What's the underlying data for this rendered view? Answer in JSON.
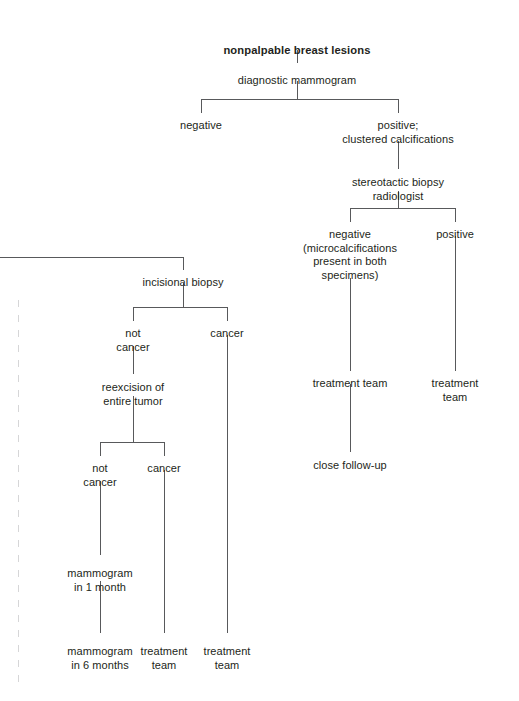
{
  "diagram": {
    "title": "nonpalpable breast lesions",
    "type": "clinical decision tree flowchart",
    "line_color": "#58595b",
    "text_color": "#231f20",
    "nodes": [
      {
        "id": "root",
        "label": "nonpalpable breast lesions",
        "x": 297,
        "y": 44,
        "bold": true
      },
      {
        "id": "dx_mammogram",
        "label": "diagnostic mammogram",
        "x": 297,
        "y": 74,
        "bold": false
      },
      {
        "id": "negative_1",
        "label": "negative",
        "x": 201,
        "y": 119,
        "bold": false
      },
      {
        "id": "positive_clustered",
        "label": "positive;\nclustered calcifications",
        "x": 398,
        "y": 119,
        "bold": false
      },
      {
        "id": "stereotactic",
        "label": "stereotactic biopsy\nradiologist",
        "x": 398,
        "y": 176,
        "bold": false
      },
      {
        "id": "stereo_negative",
        "label": "negative\n(microcalcifications\npresent in both\nspecimens)",
        "x": 350,
        "y": 228,
        "bold": false
      },
      {
        "id": "stereo_positive",
        "label": "positive",
        "x": 455,
        "y": 228,
        "bold": false
      },
      {
        "id": "tx_team_stereo_neg",
        "label": "treatment team",
        "x": 350,
        "y": 377,
        "bold": false
      },
      {
        "id": "tx_team_stereo_pos",
        "label": "treatment team",
        "x": 455,
        "y": 377,
        "bold": false
      },
      {
        "id": "close_followup",
        "label": "close follow-up",
        "x": 350,
        "y": 459,
        "bold": false
      },
      {
        "id": "incisional_biopsy",
        "label": "incisional biopsy",
        "x": 183,
        "y": 276,
        "bold": false
      },
      {
        "id": "inc_not_cancer",
        "label": "not\ncancer",
        "x": 133,
        "y": 327,
        "bold": false
      },
      {
        "id": "inc_cancer",
        "label": "cancer",
        "x": 227,
        "y": 327,
        "bold": false
      },
      {
        "id": "reexcision",
        "label": "reexcision of\nentire tumor",
        "x": 133,
        "y": 381,
        "bold": false
      },
      {
        "id": "re_not_cancer",
        "label": "not\ncancer",
        "x": 100,
        "y": 462,
        "bold": false
      },
      {
        "id": "re_cancer",
        "label": "cancer",
        "x": 164,
        "y": 462,
        "bold": false
      },
      {
        "id": "mammo_1_month",
        "label": "mammogram\nin 1 month",
        "x": 100,
        "y": 567,
        "bold": false
      },
      {
        "id": "mammo_6_months",
        "label": "mammogram\nin 6 months",
        "x": 100,
        "y": 645,
        "bold": false
      },
      {
        "id": "tx_team_re_cancer",
        "label": "treatment\nteam",
        "x": 164,
        "y": 645,
        "bold": false
      },
      {
        "id": "tx_team_inc_cancer",
        "label": "treatment\nteam",
        "x": 227,
        "y": 645,
        "bold": false
      }
    ],
    "edges": [
      {
        "id": "e-root-to-dxmammo",
        "orient": "v",
        "x": 297,
        "y": 50,
        "length": 13
      },
      {
        "id": "e-dxmammo-stem",
        "orient": "v",
        "x": 297,
        "y": 81,
        "length": 18
      },
      {
        "id": "e-dxmammo-split",
        "orient": "h",
        "x": 201,
        "y": 99,
        "length": 197
      },
      {
        "id": "e-to-negative1",
        "orient": "v",
        "x": 201,
        "y": 99,
        "length": 14
      },
      {
        "id": "e-to-positive",
        "orient": "v",
        "x": 398,
        "y": 99,
        "length": 14
      },
      {
        "id": "e-positive-to-stereo",
        "orient": "v",
        "x": 398,
        "y": 141,
        "length": 28
      },
      {
        "id": "e-stereo-stem",
        "orient": "v",
        "x": 398,
        "y": 191,
        "length": 17
      },
      {
        "id": "e-stereo-split",
        "orient": "h",
        "x": 350,
        "y": 208,
        "length": 105
      },
      {
        "id": "e-to-stereoneg",
        "orient": "v",
        "x": 350,
        "y": 208,
        "length": 14
      },
      {
        "id": "e-to-stereopos",
        "orient": "v",
        "x": 455,
        "y": 208,
        "length": 14
      },
      {
        "id": "e-stereoneg-to-tx",
        "orient": "v",
        "x": 350,
        "y": 278,
        "length": 93
      },
      {
        "id": "e-stereopos-to-tx",
        "orient": "v",
        "x": 455,
        "y": 236,
        "length": 135
      },
      {
        "id": "e-tx-to-followup",
        "orient": "v",
        "x": 350,
        "y": 384,
        "length": 68
      },
      {
        "id": "e-offpage-to-incisional",
        "orient": "h",
        "x": 0,
        "y": 257,
        "length": 183
      },
      {
        "id": "e-incisional-drop",
        "orient": "v",
        "x": 183,
        "y": 257,
        "length": 13
      },
      {
        "id": "e-incisional-stem",
        "orient": "v",
        "x": 183,
        "y": 283,
        "length": 24
      },
      {
        "id": "e-incisional-split",
        "orient": "h",
        "x": 133,
        "y": 307,
        "length": 94
      },
      {
        "id": "e-to-incnotcancer",
        "orient": "v",
        "x": 133,
        "y": 307,
        "length": 14
      },
      {
        "id": "e-to-inccancer",
        "orient": "v",
        "x": 227,
        "y": 307,
        "length": 14
      },
      {
        "id": "e-notcancer-to-reexcision",
        "orient": "v",
        "x": 133,
        "y": 346,
        "length": 28
      },
      {
        "id": "e-reexcision-stem",
        "orient": "v",
        "x": 133,
        "y": 396,
        "length": 46
      },
      {
        "id": "e-reexcision-split",
        "orient": "h",
        "x": 100,
        "y": 442,
        "length": 64
      },
      {
        "id": "e-to-renotcancer",
        "orient": "v",
        "x": 100,
        "y": 442,
        "length": 14
      },
      {
        "id": "e-to-recancer",
        "orient": "v",
        "x": 164,
        "y": 442,
        "length": 14
      },
      {
        "id": "e-renotcancer-to-mammo1",
        "orient": "v",
        "x": 100,
        "y": 481,
        "length": 74
      },
      {
        "id": "e-mammo1-to-mammo6",
        "orient": "v",
        "x": 100,
        "y": 581,
        "length": 52
      },
      {
        "id": "e-recancer-to-tx",
        "orient": "v",
        "x": 164,
        "y": 470,
        "length": 163
      },
      {
        "id": "e-inccancer-to-tx",
        "orient": "v",
        "x": 227,
        "y": 335,
        "length": 298
      }
    ]
  }
}
